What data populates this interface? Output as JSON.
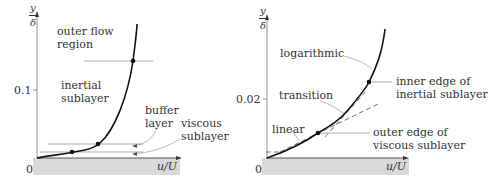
{
  "left_panel": {
    "y_axis_label_top": "y",
    "y_axis_label_bottom": "δ",
    "x_axis_label": "u/U",
    "origin_label": "0",
    "y_tick_label": "0.1",
    "regions": {
      "outer_flow_1": "outer flow",
      "outer_flow_2": "region",
      "inertial_1": "inertial",
      "inertial_2": "sublayer",
      "buffer_1": "buffer",
      "buffer_2": "layer",
      "viscous_1": "viscous",
      "viscous_2": "sublayer"
    }
  },
  "right_panel": {
    "y_axis_label_top": "y",
    "y_axis_label_bottom": "δ",
    "x_axis_label": "u/U",
    "origin_label": "0",
    "y_tick_label": "0.02",
    "annotations": {
      "logarithmic": "logarithmic",
      "transition": "transition",
      "linear": "linear",
      "inner_edge_1": "inner edge of",
      "inner_edge_2": "inertial sublayer",
      "outer_edge_1": "outer edge of",
      "outer_edge_2": "viscous sublayer"
    }
  },
  "colors": {
    "wall": "#d8d8d8",
    "curve": "#111111",
    "guide": "#888888"
  }
}
